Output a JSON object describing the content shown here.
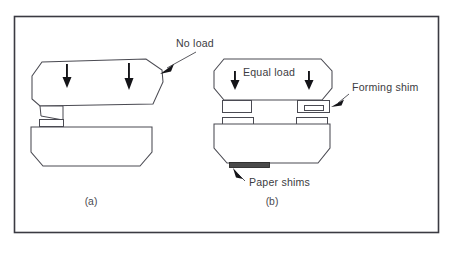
{
  "figure": {
    "border_color": "#3a3a42",
    "line_color": "#4a4a52",
    "background": "#ffffff"
  },
  "labels": {
    "no_load": "No load",
    "equal_load": "Equal load",
    "forming_shim": "Forming shim",
    "paper_shims": "Paper shims"
  },
  "captions": {
    "panel_a": "(a)",
    "panel_b": "(b)"
  },
  "panels": [
    {
      "id": "panel-a",
      "caption": "(a)",
      "condition_label": "No load",
      "upper_die_tilted": true,
      "load_arrow_count": 2,
      "shim_block_count": 1,
      "forming_shim_present": false,
      "paper_shims_present": false
    },
    {
      "id": "panel-b",
      "caption": "(b)",
      "condition_label": "Equal load",
      "upper_die_tilted": false,
      "load_arrow_count": 2,
      "shim_block_count": 2,
      "forming_shim_present": true,
      "paper_shims_present": true
    }
  ],
  "annotations": [
    {
      "name": "no-load",
      "text": "No load",
      "x": 176,
      "y": 47,
      "anchor": "start"
    },
    {
      "name": "equal-load",
      "text": "Equal load",
      "x": 243,
      "y": 76,
      "anchor": "start"
    },
    {
      "name": "forming-shim",
      "text": "Forming shim",
      "x": 352,
      "y": 91,
      "anchor": "start"
    },
    {
      "name": "paper-shims",
      "text": "Paper shims",
      "x": 249,
      "y": 186,
      "anchor": "start"
    }
  ],
  "icons": {
    "down_arrow": "down-arrow-icon",
    "leader_arrow": "leader-arrow-icon"
  }
}
